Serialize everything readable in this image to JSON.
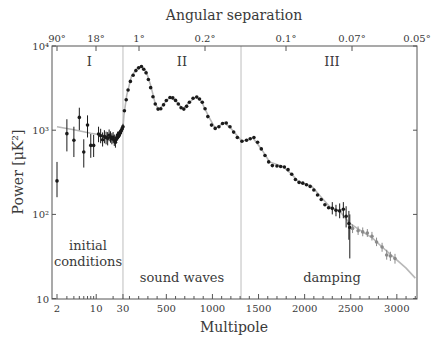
{
  "chart_data": {
    "type": "scatter",
    "title": "",
    "top_axis_label": "Angular separation",
    "xlabel": "Multipole",
    "ylabel": "Power [μK²]",
    "yscale": "log",
    "ylim": [
      10,
      10000
    ],
    "xlim": [
      2,
      3200
    ],
    "x_scale_note": "log for 2–30, linear for 30–3200",
    "yticks": [
      {
        "value": 10,
        "label": "10"
      },
      {
        "value": 100,
        "label": "10²"
      },
      {
        "value": 1000,
        "label": "10³"
      },
      {
        "value": 10000,
        "label": "10⁴"
      }
    ],
    "xticks": [
      {
        "value": 2,
        "label": "2"
      },
      {
        "value": 10,
        "label": "10"
      },
      {
        "value": 30,
        "label": "30"
      },
      {
        "value": 500,
        "label": "500"
      },
      {
        "value": 1000,
        "label": "1000"
      },
      {
        "value": 1500,
        "label": "1500"
      },
      {
        "value": 2000,
        "label": "2000"
      },
      {
        "value": 2500,
        "label": "2500"
      },
      {
        "value": 3000,
        "label": "3000"
      }
    ],
    "top_ticks": [
      {
        "value": 2,
        "label": "90°"
      },
      {
        "value": 10,
        "label": "18°"
      },
      {
        "value": 180,
        "label": "1°"
      },
      {
        "value": 900,
        "label": "0.2°"
      },
      {
        "value": 1800,
        "label": "0.1°"
      },
      {
        "value": 2570,
        "label": "0.07°"
      },
      {
        "value": 3600,
        "label": "0.05°"
      }
    ],
    "regions": [
      {
        "roman": "I",
        "label_lines": [
          "initial",
          "conditions"
        ],
        "x_from": 2,
        "x_to": 30
      },
      {
        "roman": "II",
        "label_lines": [
          "sound waves"
        ],
        "x_from": 30,
        "x_to": 1310
      },
      {
        "roman": "III",
        "label_lines": [
          "damping"
        ],
        "x_from": 1310,
        "x_to": 3200
      }
    ],
    "dividers": [
      30,
      1310
    ],
    "series": [
      {
        "name": "Theory (best-fit model)",
        "style": "line",
        "color": "#b8b8b8",
        "points": [
          [
            2,
            1100
          ],
          [
            4,
            1010
          ],
          [
            8,
            920
          ],
          [
            15,
            860
          ],
          [
            22,
            860
          ],
          [
            27,
            950
          ],
          [
            30,
            1080
          ],
          [
            40,
            1500
          ],
          [
            70,
            2600
          ],
          [
            120,
            4300
          ],
          [
            180,
            5400
          ],
          [
            230,
            5700
          ],
          [
            280,
            5000
          ],
          [
            330,
            3400
          ],
          [
            380,
            2050
          ],
          [
            420,
            1750
          ],
          [
            470,
            2050
          ],
          [
            540,
            2480
          ],
          [
            600,
            2250
          ],
          [
            680,
            1780
          ],
          [
            740,
            2100
          ],
          [
            820,
            2480
          ],
          [
            880,
            2200
          ],
          [
            960,
            1450
          ],
          [
            1030,
            1050
          ],
          [
            1130,
            1230
          ],
          [
            1200,
            1050
          ],
          [
            1320,
            740
          ],
          [
            1440,
            810
          ],
          [
            1530,
            600
          ],
          [
            1620,
            420
          ],
          [
            1765,
            370
          ],
          [
            1860,
            300
          ],
          [
            1930,
            245
          ],
          [
            2080,
            215
          ],
          [
            2180,
            160
          ],
          [
            2275,
            122
          ],
          [
            2385,
            108
          ],
          [
            2490,
            78
          ],
          [
            2630,
            62
          ],
          [
            2740,
            52
          ],
          [
            2840,
            41
          ],
          [
            2980,
            30
          ],
          [
            3100,
            23
          ],
          [
            3200,
            17.5
          ]
        ]
      },
      {
        "name": "Measured power (main data)",
        "style": "points",
        "color": "#1a1a1a",
        "points": [
          [
            2,
            250,
            160,
            420
          ],
          [
            3,
            910,
            560,
            1350
          ],
          [
            4,
            760,
            480,
            1100
          ],
          [
            5,
            1420,
            1000,
            1850
          ],
          [
            6,
            550,
            360,
            780
          ],
          [
            7,
            1150,
            820,
            1500
          ],
          [
            8,
            660,
            470,
            900
          ],
          [
            9,
            660,
            480,
            880
          ],
          [
            11,
            900,
            720,
            1100
          ],
          [
            12,
            860,
            700,
            1040
          ],
          [
            13,
            770,
            640,
            940
          ],
          [
            14,
            840,
            700,
            1000
          ],
          [
            15,
            820,
            680,
            960
          ],
          [
            16,
            800,
            660,
            950
          ],
          [
            17,
            870,
            740,
            1020
          ],
          [
            18,
            830,
            710,
            970
          ],
          [
            19,
            790,
            680,
            920
          ],
          [
            20,
            820,
            700,
            950
          ],
          [
            21,
            760,
            650,
            890
          ],
          [
            22,
            720,
            620,
            840
          ],
          [
            23,
            800,
            700,
            910
          ],
          [
            24,
            850,
            750,
            960
          ],
          [
            25,
            870,
            780,
            970
          ],
          [
            26,
            900,
            810,
            1000
          ],
          [
            27,
            930,
            840,
            1030
          ],
          [
            28,
            990,
            900,
            1090
          ],
          [
            29,
            1040,
            950,
            1140
          ],
          [
            30,
            1100,
            1010,
            1190
          ],
          [
            45,
            1700
          ],
          [
            65,
            2300
          ],
          [
            85,
            3000
          ],
          [
            110,
            3800
          ],
          [
            140,
            4500
          ],
          [
            170,
            5100
          ],
          [
            200,
            5500
          ],
          [
            230,
            5700
          ],
          [
            255,
            5300
          ],
          [
            280,
            4800
          ],
          [
            305,
            4000
          ],
          [
            330,
            3200
          ],
          [
            355,
            2500
          ],
          [
            380,
            2050
          ],
          [
            410,
            1780
          ],
          [
            440,
            1800
          ],
          [
            470,
            2000
          ],
          [
            500,
            2250
          ],
          [
            540,
            2450
          ],
          [
            570,
            2420
          ],
          [
            600,
            2260
          ],
          [
            630,
            2050
          ],
          [
            660,
            1850
          ],
          [
            690,
            1780
          ],
          [
            720,
            1920
          ],
          [
            750,
            2150
          ],
          [
            790,
            2400
          ],
          [
            830,
            2480
          ],
          [
            860,
            2350
          ],
          [
            890,
            2150
          ],
          [
            920,
            1800
          ],
          [
            950,
            1450
          ],
          [
            990,
            1150
          ],
          [
            1030,
            1050
          ],
          [
            1070,
            1100
          ],
          [
            1110,
            1200
          ],
          [
            1150,
            1220
          ],
          [
            1190,
            1100
          ],
          [
            1230,
            950
          ],
          [
            1270,
            820
          ],
          [
            1320,
            740
          ],
          [
            1370,
            760
          ],
          [
            1410,
            790
          ],
          [
            1450,
            820
          ],
          [
            1490,
            720
          ],
          [
            1530,
            600
          ],
          [
            1570,
            500
          ],
          [
            1610,
            420
          ],
          [
            1650,
            380
          ],
          [
            1700,
            375
          ],
          [
            1740,
            370
          ],
          [
            1780,
            365
          ],
          [
            1820,
            340
          ],
          [
            1860,
            300
          ],
          [
            1900,
            260
          ],
          [
            1940,
            240
          ],
          [
            1980,
            235
          ],
          [
            2020,
            225
          ],
          [
            2060,
            215
          ],
          [
            2100,
            195
          ],
          [
            2140,
            170
          ],
          [
            2180,
            150
          ],
          [
            2220,
            130
          ],
          [
            2260,
            120
          ],
          [
            2300,
            118,
            100,
            140
          ],
          [
            2340,
            112,
            95,
            130
          ],
          [
            2380,
            110,
            90,
            135
          ],
          [
            2420,
            115,
            90,
            140
          ],
          [
            2450,
            95,
            70,
            125
          ],
          [
            2480,
            78,
            50,
            110
          ],
          [
            2490,
            70,
            30,
            100
          ]
        ]
      },
      {
        "name": "Measured power (high-ℓ extension)",
        "style": "points",
        "color": "#8a8a8a",
        "points": [
          [
            2520,
            68,
            60,
            76
          ],
          [
            2580,
            64,
            57,
            72
          ],
          [
            2630,
            62,
            55,
            70
          ],
          [
            2680,
            60,
            54,
            67
          ],
          [
            2730,
            55,
            49,
            62
          ],
          [
            2780,
            47,
            42,
            53
          ],
          [
            2840,
            41,
            36,
            46
          ],
          [
            2890,
            33,
            29,
            38
          ],
          [
            2930,
            32,
            28,
            36
          ],
          [
            2980,
            30,
            26,
            34
          ]
        ]
      }
    ]
  }
}
